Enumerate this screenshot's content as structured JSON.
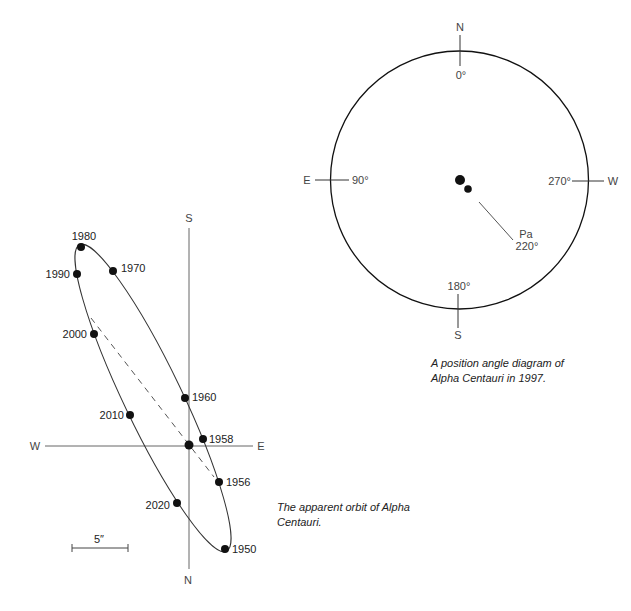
{
  "orbit_diagram": {
    "axis_labels": {
      "top": "S",
      "bottom": "N",
      "left": "W",
      "right": "E"
    },
    "scale_bar_label": "5″",
    "points": [
      {
        "year": "1950",
        "x": 225,
        "y": 549,
        "label_side": "right"
      },
      {
        "year": "1956",
        "x": 219,
        "y": 482,
        "label_side": "right"
      },
      {
        "year": "1958",
        "x": 203,
        "y": 439,
        "label_side": "right"
      },
      {
        "year": "1960",
        "x": 185,
        "y": 398,
        "label_side": "right"
      },
      {
        "year": "1970",
        "x": 113,
        "y": 271,
        "label_side": "right"
      },
      {
        "year": "1980",
        "x": 81,
        "y": 247,
        "label_side": "top"
      },
      {
        "year": "1990",
        "x": 77,
        "y": 274,
        "label_side": "left"
      },
      {
        "year": "2000",
        "x": 94,
        "y": 334,
        "label_side": "left"
      },
      {
        "year": "2010",
        "x": 130,
        "y": 415,
        "label_side": "left"
      },
      {
        "year": "2020",
        "x": 177,
        "y": 503,
        "label_side": "left"
      }
    ],
    "caption_line1": "The apparent orbit of Alpha",
    "caption_line2": "Centauri."
  },
  "position_angle_diagram": {
    "north_label": "N",
    "south_label": "S",
    "east_label": "E",
    "west_label": "W",
    "angle_0": "0°",
    "angle_90": "90°",
    "angle_180": "180°",
    "angle_270": "270°",
    "pa_label": "Pa",
    "pa_value": "220°",
    "caption_line1": "A position angle diagram of",
    "caption_line2": "Alpha Centauri in 1997."
  },
  "colors": {
    "ink": "#111111",
    "line": "#555555",
    "background": "#ffffff"
  }
}
